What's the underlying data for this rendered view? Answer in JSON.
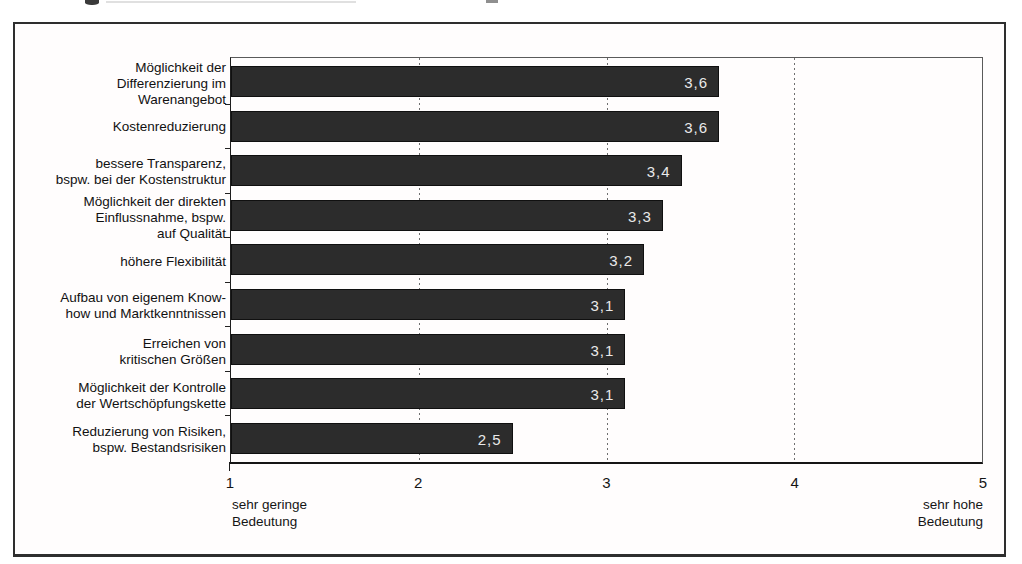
{
  "chart_data": {
    "type": "bar",
    "orientation": "horizontal",
    "title": "",
    "categories": [
      "Möglichkeit der Differenzierung im Warenangebot",
      "Kostenreduzierung",
      "bessere Transparenz, bspw. bei der Kostenstruktur",
      "Möglichkeit der direkten Einflussnahme, bspw. auf Qualität",
      "höhere Flexibilität",
      "Aufbau von eigenem Know-how und Marktkenntnissen",
      "Erreichen von kritischen Größen",
      "Möglichkeit der Kontrolle der Wertschöpfungskette",
      "Reduzierung von Risiken, bspw. Bestandsrisiken"
    ],
    "category_label_lines": [
      [
        "Möglichkeit der",
        "Differenzierung im",
        "Warenangebot"
      ],
      [
        "Kostenreduzierung"
      ],
      [
        "bessere Transparenz,",
        "bspw. bei der Kostenstruktur"
      ],
      [
        "Möglichkeit der direkten",
        "Einflussnahme, bspw.",
        "auf Qualität"
      ],
      [
        "höhere Flexibilität"
      ],
      [
        "Aufbau von eigenem Know-",
        "how und Marktkenntnissen"
      ],
      [
        "Erreichen von",
        "kritischen Größen"
      ],
      [
        "Möglichkeit der Kontrolle",
        "der Wertschöpfungskette"
      ],
      [
        "Reduzierung von Risiken,",
        "bspw. Bestandsrisiken"
      ]
    ],
    "values": [
      3.6,
      3.6,
      3.4,
      3.3,
      3.2,
      3.1,
      3.1,
      3.1,
      2.5
    ],
    "value_labels": [
      "3,6",
      "3,6",
      "3,4",
      "3,3",
      "3,2",
      "3,1",
      "3,1",
      "3,1",
      "2,5"
    ],
    "xlim": [
      1,
      5
    ],
    "x_tick_values": [
      1,
      2,
      3,
      4,
      5
    ],
    "x_tick_labels": [
      "1",
      "2",
      "3",
      "4",
      "5"
    ],
    "gridlines_x": [
      2,
      3,
      4
    ],
    "grid_style": "dotted",
    "axis_min_label_lines": [
      "sehr geringe",
      "Bedeutung"
    ],
    "axis_max_label_lines": [
      "sehr hohe",
      "Bedeutung"
    ],
    "legend_position": "none",
    "bar_color": "#2c2c2c",
    "value_text_color": "#e9e9e9"
  }
}
